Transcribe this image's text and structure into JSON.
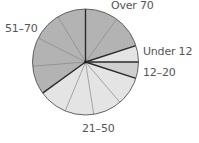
{
  "chart_data": {
    "type": "pie",
    "title": "",
    "start_angle_deg": 0,
    "direction": "clockwise",
    "slices": [
      {
        "label": "Over 70",
        "value": 20,
        "color": "#b3b3b3",
        "subdivisions": 2
      },
      {
        "label": "Under 12",
        "value": 5,
        "color": "#e4e4e4",
        "subdivisions": 1
      },
      {
        "label": "12–20",
        "value": 5,
        "color": "#cfcfcf",
        "subdivisions": 1
      },
      {
        "label": "21–50",
        "value": 35,
        "color": "#e4e4e4",
        "subdivisions": 4
      },
      {
        "label": "51–70",
        "value": 35,
        "color": "#b3b3b3",
        "subdivisions": 4
      }
    ],
    "subdivision_step_percent": 10,
    "legend": "none (direct labels)"
  },
  "labels": {
    "over70": "Over 70",
    "under12": "Under 12",
    "age12_20": "12–20",
    "age21_50": "21–50",
    "age51_70": "51–70"
  }
}
